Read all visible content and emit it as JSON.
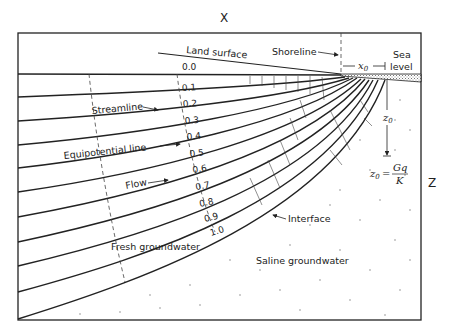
{
  "diagram": {
    "axis_x_label": "X",
    "axis_z_label": "Z",
    "labels": {
      "land_surface": "Land surface",
      "shoreline": "Shoreline",
      "sea_level_1": "Sea",
      "sea_level_2": "level",
      "x0": "x",
      "x0_sub": "0",
      "z0": "z",
      "z0_sub": "0",
      "formula_lhs": "z",
      "formula_sub": "0",
      "formula_eq": "=",
      "formula_num": "Gq",
      "formula_den": "K",
      "streamline": "Streamline",
      "equipotential": "Equipotential line",
      "flow": "Flow",
      "interface": "Interface",
      "fresh": "Fresh groundwater",
      "saline": "Saline groundwater"
    },
    "streamline_values": [
      "0.0",
      "0.1",
      "0.2",
      "0.3",
      "0.4",
      "0.5",
      "0.6",
      "0.7",
      "0.8",
      "0.9",
      "1.0"
    ],
    "colors": {
      "line": "#1a1a1a",
      "background": "#ffffff",
      "sea_hatch": "#888888"
    }
  }
}
